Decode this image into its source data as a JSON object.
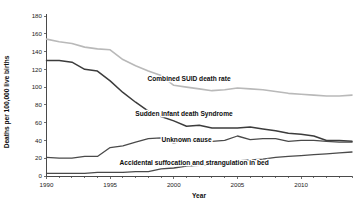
{
  "chart_data": {
    "type": "line",
    "title": "",
    "subtitle": "",
    "xlabel": "Year",
    "ylabel": "Deaths per 100,000 live births",
    "xlim": [
      1990,
      2014
    ],
    "ylim": [
      0,
      180
    ],
    "ytick_step": 20,
    "yticks": [
      0,
      20,
      40,
      60,
      80,
      100,
      120,
      140,
      160,
      180
    ],
    "ytick_labels": [
      "0",
      "20",
      "40",
      "60",
      "80",
      "100",
      "120",
      "140",
      "160",
      "180"
    ],
    "xticks_major": [
      1990,
      1995,
      2000,
      2005,
      2010
    ],
    "xtick_labels": [
      "1990",
      "1995",
      "2000",
      "2005",
      "2010"
    ],
    "xtick_minor_step": 1,
    "grid": false,
    "legend_position": "inline-annotations",
    "x": [
      1990,
      1991,
      1992,
      1993,
      1994,
      1995,
      1996,
      1997,
      1998,
      1999,
      2000,
      2001,
      2002,
      2003,
      2004,
      2005,
      2006,
      2007,
      2008,
      2009,
      2010,
      2011,
      2012,
      2013,
      2014
    ],
    "series": [
      {
        "name": "Combined SUID death rate",
        "color": "#b9b9b9",
        "width": 1.6,
        "label_x": 2001.2,
        "label_y": 107,
        "values": [
          154,
          151,
          149,
          145,
          143,
          142,
          131,
          124,
          118,
          113,
          102,
          100,
          98,
          96,
          97,
          99,
          98,
          97,
          95,
          93,
          92,
          91,
          90,
          90,
          91
        ]
      },
      {
        "name": "Sudden infant death Syndrome",
        "color": "#3c3c3c",
        "width": 1.5,
        "label_x": 2000.8,
        "label_y": 68,
        "values": [
          130,
          130,
          128,
          120,
          118,
          107,
          94,
          83,
          73,
          67,
          62,
          56,
          57,
          54,
          54,
          54,
          55,
          53,
          51,
          48,
          47,
          45,
          40,
          40,
          39
        ]
      },
      {
        "name": "Unknown cause",
        "color": "#4a4a4a",
        "width": 1.3,
        "label_x": 2001.0,
        "label_y": 38,
        "values": [
          21,
          20,
          20,
          22,
          22,
          32,
          34,
          38,
          42,
          43,
          37,
          41,
          38,
          39,
          40,
          45,
          41,
          42,
          42,
          39,
          40,
          40,
          39,
          38,
          38
        ]
      },
      {
        "name": "Accidental suffocation and strangulation in bed",
        "color": "#4a4a4a",
        "width": 1.3,
        "label_x": 2001.6,
        "label_y": 12,
        "values": [
          3,
          3,
          3,
          3,
          4,
          4,
          4,
          5,
          5,
          8,
          9,
          11,
          12,
          13,
          14,
          17,
          18,
          19,
          21,
          22,
          23,
          24,
          25,
          26,
          27
        ]
      }
    ]
  }
}
